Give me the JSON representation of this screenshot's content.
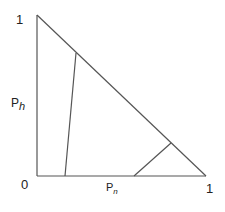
{
  "diagram": {
    "type": "simplex-triangle",
    "labels": {
      "y_top": "1",
      "origin": "0",
      "x_right": "1",
      "y_axis": "P",
      "y_axis_sub": "h",
      "x_axis": "P",
      "x_axis_sub": "n"
    },
    "line_color": "#555555",
    "vertices": {
      "top": [
        37,
        15
      ],
      "origin": [
        37,
        176
      ],
      "right": [
        206,
        176
      ]
    },
    "inner_lines": [
      {
        "from": [
          65,
          176
        ],
        "to": [
          76,
          53
        ]
      },
      {
        "from": [
          134,
          176
        ],
        "to": [
          171,
          143
        ]
      }
    ]
  }
}
